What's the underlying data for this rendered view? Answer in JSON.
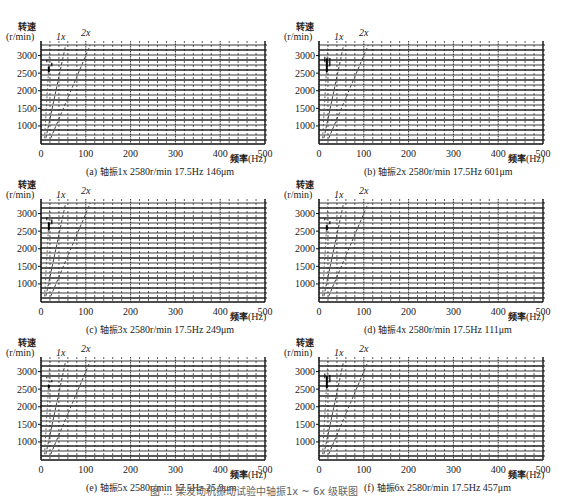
{
  "figure_caption": "图 ... 某发动机振动试验中轴振1x ~ 6x 级联图",
  "common": {
    "ylabel_line1": "转速",
    "ylabel_line2": "(r/min)",
    "xlabel_zh": "频率",
    "xlabel_unit": "(Hz)",
    "order_labels": [
      "1x",
      "2x"
    ],
    "xticks": [
      0,
      100,
      200,
      300,
      400,
      500
    ],
    "yticks": [
      1000,
      1500,
      2000,
      2500,
      3000
    ]
  },
  "panels": [
    {
      "id": "a",
      "caption_prefix": "(a) ",
      "caption_zh": "轴振",
      "caption_rest": "1x  2580r/min  17.5Hz  146μm"
    },
    {
      "id": "b",
      "caption_prefix": "(b) ",
      "caption_zh": "轴振",
      "caption_rest": "2x  2580r/min  17.5Hz  601μm"
    },
    {
      "id": "c",
      "caption_prefix": "(c) ",
      "caption_zh": "轴振",
      "caption_rest": "3x  2580r/min  17.5Hz  249μm"
    },
    {
      "id": "d",
      "caption_prefix": "(d) ",
      "caption_zh": "轴振",
      "caption_rest": "4x  2580r/min  17.5Hz  111μm"
    },
    {
      "id": "e",
      "caption_prefix": "(e) ",
      "caption_zh": "轴振",
      "caption_rest": "5x  2580r/min  17.5Hz  25.9μm"
    },
    {
      "id": "f",
      "caption_prefix": "(f) ",
      "caption_zh": "轴振",
      "caption_rest": "6x  2580r/min  17.5Hz  457μm"
    }
  ],
  "chart_data": [
    {
      "type": "waterfall",
      "title": "(a) 轴振1x 2580r/min 17.5Hz 146μm",
      "xlabel": "频率 (Hz)",
      "ylabel": "转速 (r/min)",
      "xlim": [
        0,
        500
      ],
      "ylim": [
        600,
        3300
      ],
      "xticks": [
        0,
        100,
        200,
        300,
        400,
        500
      ],
      "yticks": [
        1000,
        1500,
        2000,
        2500,
        3000
      ],
      "order_lines": [
        {
          "name": "1x",
          "hz_per_rpm": 0.01667
        },
        {
          "name": "2x",
          "hz_per_rpm": 0.03333
        }
      ],
      "peak": {
        "rpm": 2580,
        "freq_hz": 17.5,
        "amplitude_um": 146
      }
    },
    {
      "type": "waterfall",
      "title": "(b) 轴振2x 2580r/min 17.5Hz 601μm",
      "xlabel": "频率 (Hz)",
      "ylabel": "转速 (r/min)",
      "xlim": [
        0,
        500
      ],
      "ylim": [
        600,
        3300
      ],
      "xticks": [
        0,
        100,
        200,
        300,
        400,
        500
      ],
      "yticks": [
        1000,
        1500,
        2000,
        2500,
        3000
      ],
      "order_lines": [
        {
          "name": "1x",
          "hz_per_rpm": 0.01667
        },
        {
          "name": "2x",
          "hz_per_rpm": 0.03333
        }
      ],
      "peak": {
        "rpm": 2580,
        "freq_hz": 17.5,
        "amplitude_um": 601
      }
    },
    {
      "type": "waterfall",
      "title": "(c) 轴振3x 2580r/min 17.5Hz 249μm",
      "xlabel": "频率 (Hz)",
      "ylabel": "转速 (r/min)",
      "xlim": [
        0,
        500
      ],
      "ylim": [
        600,
        3300
      ],
      "xticks": [
        0,
        100,
        200,
        300,
        400,
        500
      ],
      "yticks": [
        1000,
        1500,
        2000,
        2500,
        3000
      ],
      "order_lines": [
        {
          "name": "1x",
          "hz_per_rpm": 0.01667
        },
        {
          "name": "2x",
          "hz_per_rpm": 0.03333
        }
      ],
      "peak": {
        "rpm": 2580,
        "freq_hz": 17.5,
        "amplitude_um": 249
      }
    },
    {
      "type": "waterfall",
      "title": "(d) 轴振4x 2580r/min 17.5Hz 111μm",
      "xlabel": "频率 (Hz)",
      "ylabel": "转速 (r/min)",
      "xlim": [
        0,
        500
      ],
      "ylim": [
        600,
        3300
      ],
      "xticks": [
        0,
        100,
        200,
        300,
        400,
        500
      ],
      "yticks": [
        1000,
        1500,
        2000,
        2500,
        3000
      ],
      "order_lines": [
        {
          "name": "1x",
          "hz_per_rpm": 0.01667
        },
        {
          "name": "2x",
          "hz_per_rpm": 0.03333
        }
      ],
      "peak": {
        "rpm": 2580,
        "freq_hz": 17.5,
        "amplitude_um": 111
      }
    },
    {
      "type": "waterfall",
      "title": "(e) 轴振5x 2580r/min 17.5Hz 25.9μm",
      "xlabel": "频率 (Hz)",
      "ylabel": "转速 (r/min)",
      "xlim": [
        0,
        500
      ],
      "ylim": [
        600,
        3300
      ],
      "xticks": [
        0,
        100,
        200,
        300,
        400,
        500
      ],
      "yticks": [
        1000,
        1500,
        2000,
        2500,
        3000
      ],
      "order_lines": [
        {
          "name": "1x",
          "hz_per_rpm": 0.01667
        },
        {
          "name": "2x",
          "hz_per_rpm": 0.03333
        }
      ],
      "peak": {
        "rpm": 2580,
        "freq_hz": 17.5,
        "amplitude_um": 25.9
      }
    },
    {
      "type": "waterfall",
      "title": "(f) 轴振6x 2580r/min 17.5Hz 457μm",
      "xlabel": "频率 (Hz)",
      "ylabel": "转速 (r/min)",
      "xlim": [
        0,
        500
      ],
      "ylim": [
        600,
        3300
      ],
      "xticks": [
        0,
        100,
        200,
        300,
        400,
        500
      ],
      "yticks": [
        1000,
        1500,
        2000,
        2500,
        3000
      ],
      "order_lines": [
        {
          "name": "1x",
          "hz_per_rpm": 0.01667
        },
        {
          "name": "2x",
          "hz_per_rpm": 0.03333
        }
      ],
      "peak": {
        "rpm": 2580,
        "freq_hz": 17.5,
        "amplitude_um": 457
      }
    }
  ]
}
